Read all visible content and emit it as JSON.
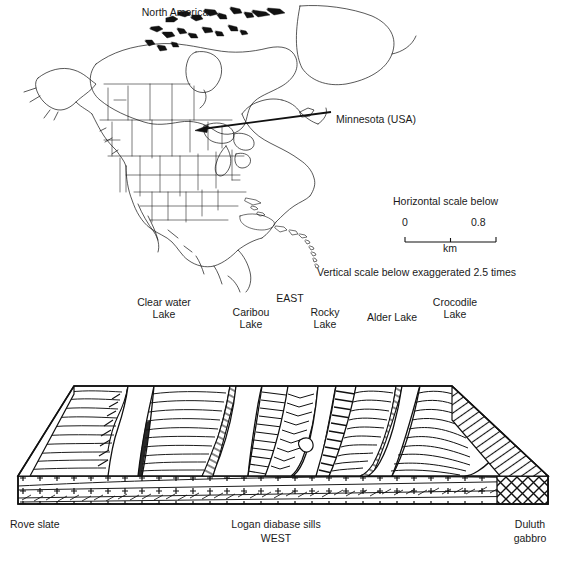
{
  "figure": {
    "type": "geological-block-diagram-with-locator-map",
    "map": {
      "title": "North America",
      "annotation_label": "Minnesota (USA)",
      "pointer": "arrow-pointing-to-minnesota"
    },
    "scale": {
      "heading": "Horizontal scale below",
      "min_label": "0",
      "max_label": "0.8",
      "unit": "km",
      "vertical_note": "Vertical scale below exaggerated 2.5 times"
    },
    "block": {
      "direction_east": "EAST",
      "direction_west": "WEST",
      "lake_labels": [
        {
          "id": "clear-water-lake",
          "line1": "Clear water",
          "line2": "Lake"
        },
        {
          "id": "caribou-lake",
          "line1": "Caribou",
          "line2": "Lake"
        },
        {
          "id": "rocky-lake",
          "line1": "Rocky",
          "line2": "Lake"
        },
        {
          "id": "alder-lake",
          "line1": "Alder Lake",
          "line2": ""
        },
        {
          "id": "crocodile-lake",
          "line1": "Crocodile",
          "line2": "Lake"
        }
      ],
      "unit_labels": [
        {
          "id": "rove-slate",
          "line1": "Rove slate",
          "line2": ""
        },
        {
          "id": "logan-diabase-sills",
          "line1": "Logan diabase sills",
          "line2": ""
        },
        {
          "id": "duluth-gabbro",
          "line1": "Duluth",
          "line2": "gabbro"
        }
      ]
    },
    "colors": {
      "ink": "#111111",
      "text": "#1a1a1a",
      "paper": "#ffffff"
    }
  }
}
